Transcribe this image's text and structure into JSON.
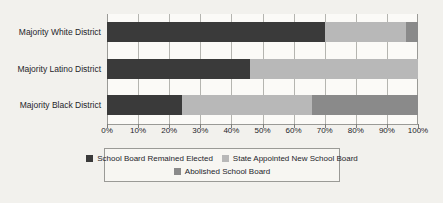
{
  "chart_data": {
    "type": "bar",
    "orientation": "horizontal",
    "stacked": true,
    "normalized": "100%",
    "title": "",
    "xlabel": "",
    "ylabel": "",
    "xlim": [
      0,
      100
    ],
    "grid": true,
    "legend_position": "bottom",
    "categories": [
      "Majority White District",
      "Majority Latino District",
      "Majority Black District"
    ],
    "tick_labels": [
      "0%",
      "10%",
      "20%",
      "30%",
      "40%",
      "50%",
      "60%",
      "70%",
      "80%",
      "90%",
      "100%"
    ],
    "tick_values": [
      0,
      10,
      20,
      30,
      40,
      50,
      60,
      70,
      80,
      90,
      100
    ],
    "series": [
      {
        "name": "School Board Remained Elected",
        "color": "#3a3a3a",
        "values": [
          70,
          46,
          24
        ]
      },
      {
        "name": "State Appointed New School Board",
        "color": "#b8b8b8",
        "values": [
          26,
          54,
          42
        ]
      },
      {
        "name": "Abolished School Board",
        "color": "#8a8a8a",
        "values": [
          4,
          0,
          34
        ]
      }
    ]
  },
  "legend": {
    "row1": [
      {
        "label": "School Board Remained Elected",
        "color": "#3a3a3a"
      },
      {
        "label": "State Appointed New School Board",
        "color": "#b8b8b8"
      }
    ],
    "row2": [
      {
        "label": "Abolished School Board",
        "color": "#8a8a8a"
      }
    ]
  },
  "colors": {
    "background": "#f2f1ed",
    "plot_background": "#fbfaf7",
    "gridline": "#b5b5b0",
    "axis": "#9a9a96",
    "text": "#25252a"
  }
}
